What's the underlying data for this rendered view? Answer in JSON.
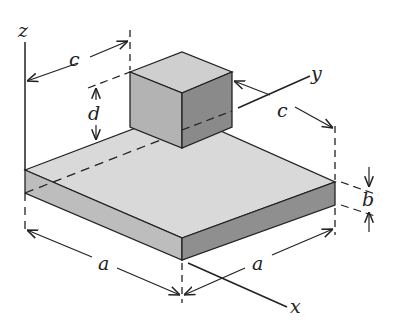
{
  "figure": {
    "axes": {
      "x": "x",
      "y": "y",
      "z": "z"
    },
    "dimensions": {
      "c_top": "c",
      "c_right": "c",
      "d": "d",
      "b": "b",
      "a_left": "a",
      "a_right": "a"
    },
    "colors": {
      "plate_top": "#d9d9d9",
      "plate_front_left": "#bdbdbd",
      "plate_front_right": "#8f8f8f",
      "cube_top": "#cfcfcf",
      "cube_left": "#b3b3b3",
      "cube_right": "#8a8a8a",
      "line": "#222222"
    }
  }
}
